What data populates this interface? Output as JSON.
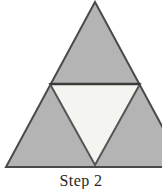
{
  "figure": {
    "caption": "Step 2",
    "caption_cropped": true,
    "canvas": {
      "width": 162,
      "height": 189
    },
    "colors": {
      "background": "#ffffff",
      "filled_triangle": "#b4b4b4",
      "hole_triangle": "#f4f4f1",
      "outline": "#4a4a4a",
      "midline": "#3a3a3a",
      "caption_text": "#262626"
    },
    "geometry": {
      "outer_triangle": {
        "apex": [
          95,
          2
        ],
        "bottom_left": [
          6,
          167
        ],
        "bottom_right": [
          184,
          167
        ]
      },
      "midpoints": {
        "left_mid": [
          50,
          84
        ],
        "right_mid": [
          140,
          84
        ],
        "bottom_mid": [
          95,
          167
        ]
      },
      "hole_triangle": {
        "left": [
          50,
          84
        ],
        "right": [
          140,
          84
        ],
        "bottom": [
          95,
          165
        ]
      },
      "stroke_width": 2,
      "midline_width": 2.4
    },
    "subtriangles": [
      {
        "name": "top-filled",
        "points": "95,2 50,84 140,84",
        "fill": "#b4b4b4"
      },
      {
        "name": "bottom-left-filled",
        "points": "50,84 6,167 95,167",
        "fill": "#b4b4b4"
      },
      {
        "name": "bottom-right-filled",
        "points": "140,84 95,167 184,167",
        "fill": "#b4b4b4"
      },
      {
        "name": "center-hole",
        "points": "50,84 140,84 95,165",
        "fill": "#f4f4f1"
      }
    ]
  }
}
